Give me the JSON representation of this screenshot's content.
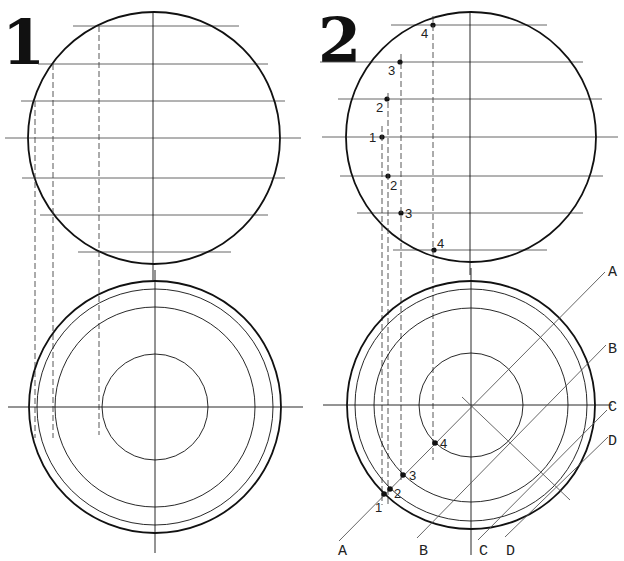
{
  "figures": {
    "fig1": {
      "number": "1",
      "side_view": {
        "center": [
          154,
          138
        ],
        "radius": 126,
        "h_lines": [
          {
            "y": 26,
            "x1": 73,
            "x2": 239
          },
          {
            "y": 64,
            "x1": 38,
            "x2": 268
          },
          {
            "y": 101,
            "x1": 21,
            "x2": 285
          },
          {
            "y": 138,
            "x1": 5,
            "x2": 301
          },
          {
            "y": 178,
            "x1": 22,
            "x2": 285
          },
          {
            "y": 215,
            "x1": 40,
            "x2": 268
          },
          {
            "y": 252,
            "x1": 78,
            "x2": 231
          }
        ],
        "v_axis": {
          "x": 153,
          "y1": 13,
          "y2": 280
        }
      },
      "projection_dashes": [
        {
          "x": 35,
          "y1": 101,
          "y2": 438
        },
        {
          "x": 53,
          "y1": 64,
          "y2": 438
        },
        {
          "x": 99,
          "y1": 26,
          "y2": 435
        }
      ],
      "top_view": {
        "center": [
          155,
          407
        ],
        "radii": [
          126,
          118,
          100,
          53
        ],
        "h_axis": {
          "y": 407,
          "x1": 8,
          "x2": 303
        },
        "v_axis": {
          "x": 155,
          "y1": 270,
          "y2": 553
        }
      }
    },
    "fig2": {
      "number": "2",
      "side_view": {
        "center": [
          471,
          137
        ],
        "radius": 125,
        "h_lines": [
          {
            "y": 25,
            "x1": 391,
            "x2": 547
          },
          {
            "y": 62,
            "x1": 320,
            "x2": 583
          },
          {
            "y": 99,
            "x1": 338,
            "x2": 602
          },
          {
            "y": 137,
            "x1": 322,
            "x2": 618
          },
          {
            "y": 176,
            "x1": 340,
            "x2": 603
          },
          {
            "y": 213,
            "x1": 357,
            "x2": 583
          },
          {
            "y": 250,
            "x1": 393,
            "x2": 547
          }
        ],
        "v_axis": {
          "x": 470,
          "y1": 11,
          "y2": 275
        },
        "points": [
          {
            "label": "4",
            "x": 433,
            "y": 25,
            "lx": 421,
            "ly": 38
          },
          {
            "label": "3",
            "x": 400,
            "y": 62,
            "lx": 388,
            "ly": 75
          },
          {
            "label": "2",
            "x": 387,
            "y": 99,
            "lx": 376,
            "ly": 112
          },
          {
            "label": "1",
            "x": 382,
            "y": 137,
            "lx": 369,
            "ly": 142
          },
          {
            "label": "2",
            "x": 388,
            "y": 176,
            "lx": 390,
            "ly": 190
          },
          {
            "label": "3",
            "x": 401,
            "y": 213,
            "lx": 405,
            "ly": 218
          },
          {
            "label": "4",
            "x": 434,
            "y": 250,
            "lx": 437,
            "ly": 248
          }
        ]
      },
      "projection_dashes": [
        {
          "x": 382,
          "y1": 126,
          "y2": 505
        },
        {
          "x": 388,
          "y1": 93,
          "y2": 505
        },
        {
          "x": 401,
          "y1": 54,
          "y2": 480
        },
        {
          "x": 433,
          "y1": 16,
          "y2": 460
        }
      ],
      "top_view": {
        "center": [
          471,
          405
        ],
        "radii": [
          124,
          116,
          97,
          52
        ],
        "h_axis": {
          "y": 405,
          "x1": 323,
          "x2": 612
        },
        "v_axis": {
          "x": 471,
          "y1": 268,
          "y2": 555
        },
        "points": [
          {
            "label": "4",
            "x": 435,
            "y": 443,
            "lx": 440,
            "ly": 448
          },
          {
            "label": "3",
            "x": 403,
            "y": 475,
            "lx": 409,
            "ly": 480
          },
          {
            "label": "2",
            "x": 390,
            "y": 489,
            "lx": 394,
            "ly": 498
          },
          {
            "label": "1",
            "x": 384,
            "y": 494,
            "lx": 375,
            "ly": 512
          }
        ],
        "section_lines": [
          {
            "label": "A",
            "x1": 339,
            "y1": 541,
            "x2": 605,
            "y2": 272,
            "l1x": 338,
            "l1y": 555,
            "l2x": 608,
            "l2y": 276
          },
          {
            "label": "B",
            "x1": 417,
            "y1": 538,
            "x2": 606,
            "y2": 345,
            "l1x": 419,
            "l1y": 555,
            "l2x": 608,
            "l2y": 353
          },
          {
            "label": "C",
            "x1": 478,
            "y1": 540,
            "x2": 607,
            "y2": 410,
            "l1x": 479,
            "l1y": 555,
            "l2x": 608,
            "l2y": 411
          },
          {
            "label": "D",
            "x1": 505,
            "y1": 537,
            "x2": 608,
            "y2": 437,
            "l1x": 506,
            "l1y": 555,
            "l2x": 608,
            "l2y": 445
          }
        ],
        "perpendicular": {
          "x1": 462,
          "y1": 397,
          "x2": 570,
          "y2": 500
        }
      }
    }
  },
  "colors": {
    "outline": "#111111",
    "construction": "#555555",
    "dash": "#444444"
  }
}
